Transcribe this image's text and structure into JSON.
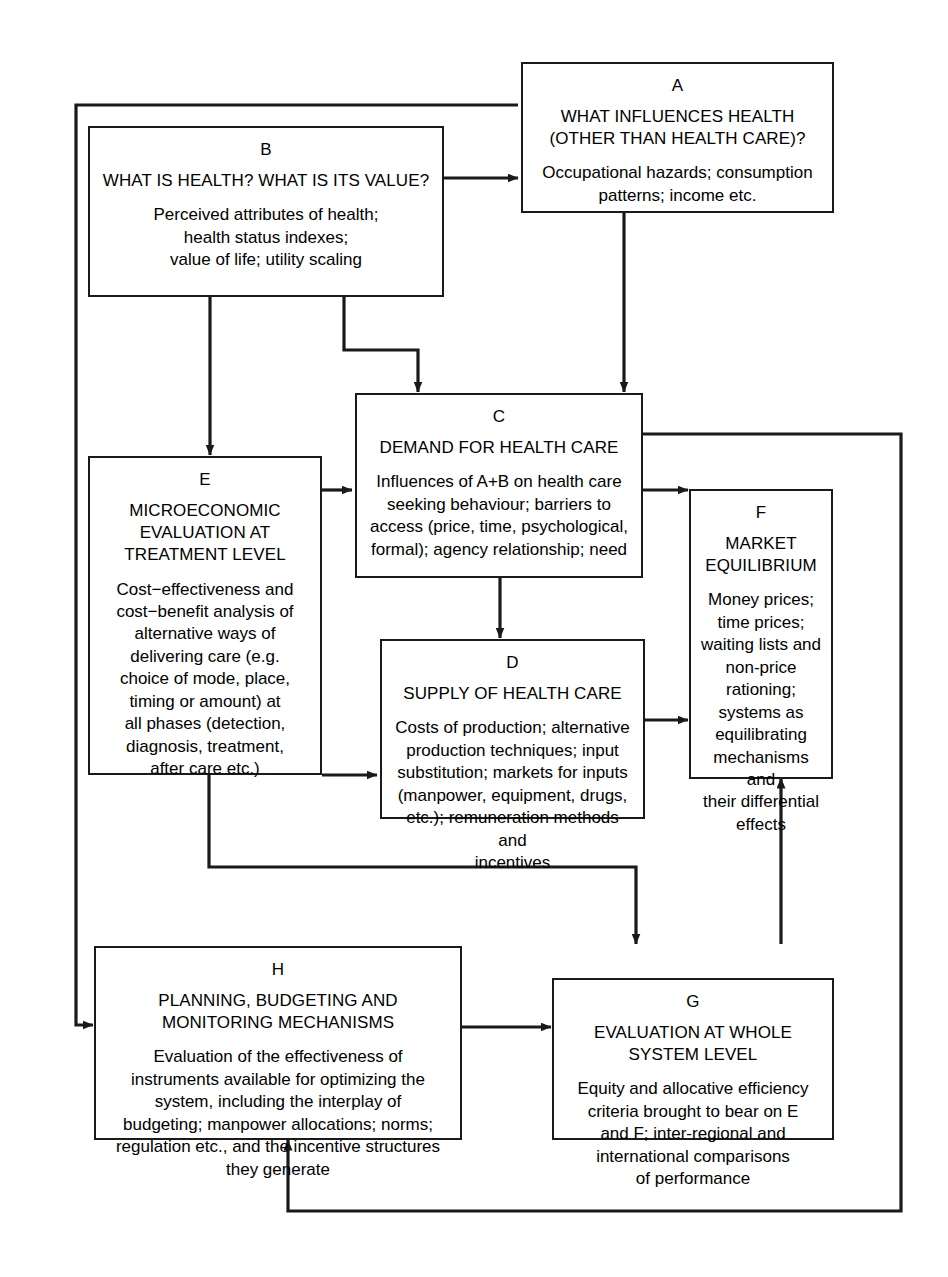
{
  "diagram": {
    "line_color": "#1a1a1a",
    "background": "#ffffff",
    "boxes": [
      {
        "key": "A",
        "id": "A",
        "title": "WHAT INFLUENCES HEALTH\n(OTHER THAN HEALTH CARE)?",
        "body": "Occupational hazards; consumption\npatterns; income etc."
      },
      {
        "key": "B",
        "id": "B",
        "title": "WHAT IS HEALTH? WHAT IS ITS VALUE?",
        "body": "Perceived attributes of health;\nhealth status indexes;\nvalue of life; utility scaling"
      },
      {
        "key": "C",
        "id": "C",
        "title": "DEMAND FOR HEALTH CARE",
        "body": "Influences of A+B on health care\nseeking behaviour; barriers to\naccess (price, time, psychological,\nformal); agency relationship; need"
      },
      {
        "key": "D",
        "id": "D",
        "title": "SUPPLY OF HEALTH CARE",
        "body": "Costs of production; alternative\nproduction techniques; input\nsubstitution; markets for inputs\n(manpower, equipment, drugs,\netc.); remuneration methods and\nincentives"
      },
      {
        "key": "E",
        "id": "E",
        "title": "MICROECONOMIC\nEVALUATION AT\nTREATMENT LEVEL",
        "body": "Cost−effectiveness and\ncost−benefit analysis of\nalternative ways of\ndelivering care (e.g.\nchoice of mode, place,\ntiming or amount) at\nall phases (detection,\ndiagnosis, treatment,\nafter care etc.)"
      },
      {
        "key": "F",
        "id": "F",
        "title": "MARKET\nEQUILIBRIUM",
        "body": "Money prices;\ntime prices;\nwaiting lists and\nnon-price\nrationing;\nsystems as\nequilibrating\nmechanisms and\ntheir differential\neffects"
      },
      {
        "key": "G",
        "id": "G",
        "title": "EVALUATION AT WHOLE\nSYSTEM LEVEL",
        "body": "Equity and allocative efficiency\ncriteria brought to bear on E\nand F; inter-regional and\ninternational comparisons\nof performance"
      },
      {
        "key": "H",
        "id": "H",
        "title": "PLANNING, BUDGETING AND\nMONITORING MECHANISMS",
        "body": "Evaluation of the effectiveness of\ninstruments available for optimizing the\nsystem, including the interplay of\nbudgeting; manpower allocations; norms;\nregulation etc., and the incentive structures\nthey generate"
      }
    ],
    "connections": [
      {
        "from": "B",
        "to": "A",
        "kind": "arrow"
      },
      {
        "from": "A",
        "to": "C",
        "kind": "arrow"
      },
      {
        "from": "B",
        "to": "C",
        "kind": "arrow"
      },
      {
        "from": "B",
        "to": "E",
        "kind": "arrow"
      },
      {
        "from": "E",
        "to": "C",
        "kind": "arrow"
      },
      {
        "from": "C",
        "to": "D",
        "kind": "arrow"
      },
      {
        "from": "C",
        "to": "F",
        "kind": "arrow"
      },
      {
        "from": "E",
        "to": "D",
        "kind": "arrow"
      },
      {
        "from": "D",
        "to": "F",
        "kind": "arrow"
      },
      {
        "from": "E",
        "to": "G",
        "kind": "arrow"
      },
      {
        "from": "C",
        "to": "H",
        "kind": "feedback-loop"
      },
      {
        "from": "H",
        "to": "G",
        "kind": "arrow"
      },
      {
        "from": "G",
        "to": "F",
        "kind": "arrow"
      },
      {
        "from": "G",
        "to": "H",
        "kind": "feedback-loop"
      },
      {
        "from": "A",
        "to": "H",
        "kind": "feedback-loop"
      }
    ]
  }
}
